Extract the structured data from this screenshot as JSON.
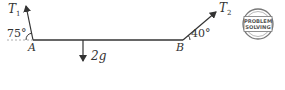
{
  "diagram": {
    "type": "force-diagram",
    "rod": {
      "left_point": "A",
      "right_point": "B"
    },
    "forces": [
      {
        "name": "T",
        "subscript": "1",
        "at": "A",
        "angle_label": "75°",
        "direction": "up-left"
      },
      {
        "name": "T",
        "subscript": "2",
        "at": "B",
        "angle_label": "40°",
        "direction": "up-right"
      },
      {
        "name": "weight",
        "label": "2g",
        "direction": "down"
      }
    ],
    "points": {
      "A": "A",
      "B": "B"
    },
    "labels": {
      "t1_main": "T",
      "t1_sub": "1",
      "t2_main": "T",
      "t2_sub": "2",
      "angle_a": "75°",
      "angle_b": "40°",
      "point_a": "A",
      "point_b": "B",
      "weight": "2g"
    },
    "stamp": {
      "line1": "PROBLEM",
      "line2": "SOLVING"
    },
    "colors": {
      "line": "#333333",
      "stamp": "#666666",
      "background": "#ffffff"
    }
  }
}
